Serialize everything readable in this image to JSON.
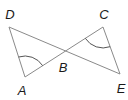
{
  "diagram": {
    "type": "geometry",
    "colors": {
      "line": "#8a8a8a",
      "arc": "#555555",
      "label": "#1a1a1a"
    },
    "points": {
      "D": {
        "label": "D",
        "x": 9,
        "y": 27,
        "label_x": 10,
        "label_y": 14
      },
      "A": {
        "label": "A",
        "x": 25,
        "y": 77,
        "label_x": 22,
        "label_y": 90
      },
      "B": {
        "label": "B",
        "x": 65,
        "y": 52,
        "label_x": 63,
        "label_y": 67
      },
      "C": {
        "label": "C",
        "x": 103,
        "y": 27,
        "label_x": 104,
        "label_y": 14
      },
      "E": {
        "label": "E",
        "x": 120,
        "y": 74,
        "label_x": 121,
        "label_y": 88
      }
    },
    "segments": [
      {
        "from": "D",
        "to": "A"
      },
      {
        "from": "D",
        "to": "E"
      },
      {
        "from": "A",
        "to": "C"
      },
      {
        "from": "C",
        "to": "E"
      }
    ],
    "angle_marks": [
      {
        "vertex": "A",
        "between": [
          "D",
          "B"
        ]
      },
      {
        "vertex": "C",
        "between": [
          "B",
          "E"
        ]
      }
    ]
  }
}
